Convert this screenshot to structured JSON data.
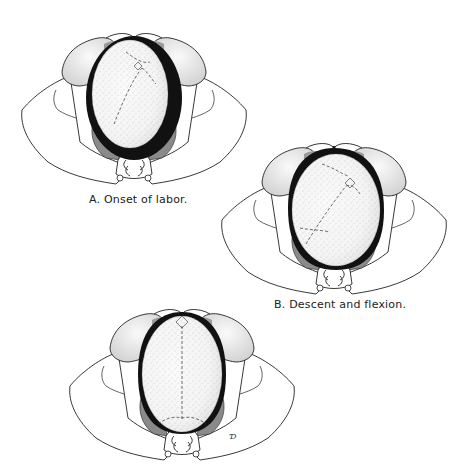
{
  "figure": {
    "panels": [
      {
        "id": "A",
        "caption": "A.  Onset of labor.",
        "stage": "onset-of-labor"
      },
      {
        "id": "B",
        "caption": "B.  Descent and flexion.",
        "stage": "descent-and-flexion"
      },
      {
        "id": "C",
        "caption": "",
        "stage": "internal-rotation"
      }
    ],
    "artist_mark": "Ɗ",
    "colors": {
      "outline": "#222222",
      "dark_band": "#111111",
      "shade": "#8a8a8a",
      "head_fill": "#f2f2f2",
      "background": "#ffffff"
    }
  }
}
